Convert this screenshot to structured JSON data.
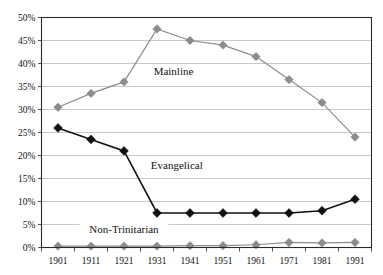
{
  "chart_data": {
    "type": "line",
    "title": "",
    "title_note": "chart title is cropped off the top edge of the screenshot and is not legible",
    "xlabel": "",
    "ylabel": "",
    "categories": [
      "1901",
      "1911",
      "1921",
      "1931",
      "1941",
      "1951",
      "1961",
      "1971",
      "1981",
      "1991"
    ],
    "x": [
      1901,
      1911,
      1921,
      1931,
      1941,
      1951,
      1961,
      1971,
      1981,
      1991
    ],
    "ylim": [
      0,
      50
    ],
    "ytick_labels": [
      "50%",
      "45%",
      "40%",
      "35%",
      "30%",
      "25%",
      "20%",
      "15%",
      "10%",
      "5%",
      "0%"
    ],
    "ytick_values": [
      50,
      45,
      40,
      35,
      30,
      25,
      20,
      15,
      10,
      5,
      0
    ],
    "grid": true,
    "grid_axis": "y",
    "legend": "inline-series-labels",
    "value_unit": "percent",
    "series": [
      {
        "name": "Mainline",
        "color": "#8c8c8c",
        "marker": "diamond",
        "label_x": 1936,
        "label_y": 37.5,
        "values": [
          30.5,
          33.5,
          36.0,
          47.5,
          45.0,
          44.0,
          41.5,
          36.5,
          31.5,
          24.0
        ]
      },
      {
        "name": "Evangelical",
        "color": "#111111",
        "marker": "diamond",
        "label_x": 1937,
        "label_y": 17.0,
        "values": [
          26.0,
          23.5,
          21.0,
          7.5,
          7.5,
          7.5,
          7.5,
          7.5,
          8.0,
          10.5
        ]
      },
      {
        "name": "Non-Trinitarian",
        "color": "#8c8c8c",
        "marker": "diamond",
        "label_x": 1921,
        "label_y": 3.2,
        "values": [
          0.3,
          0.3,
          0.3,
          0.3,
          0.4,
          0.4,
          0.6,
          1.1,
          1.0,
          1.1
        ]
      }
    ]
  },
  "colors": {
    "mainline": "#8c8c8c",
    "evangelical": "#111111",
    "non_trinitarian": "#8c8c8c",
    "gridline": "#b0b0b0",
    "axis": "#2b2b2b",
    "background": "#ffffff"
  }
}
